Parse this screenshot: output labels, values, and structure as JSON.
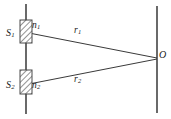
{
  "figure": {
    "type": "optics-ray-diagram",
    "background_color": "#ffffff",
    "line_color": "#3a3a3a",
    "hatch_color": "#6b6b6b"
  },
  "labels": {
    "slit_top": {
      "base": "S",
      "sub": "1"
    },
    "slit_bottom": {
      "base": "S",
      "sub": "2"
    },
    "index_top": {
      "base": "n",
      "sub": "1"
    },
    "index_bottom": {
      "base": "n",
      "sub": "2"
    },
    "ray_top": {
      "base": "r",
      "sub": "1"
    },
    "ray_bottom": {
      "base": "r",
      "sub": "2"
    },
    "observation_point": {
      "base": "O",
      "sub": ""
    }
  },
  "geometry": {
    "barrier_line": {
      "x": 26,
      "y1": 4,
      "y2": 114
    },
    "screen_line": {
      "x": 157,
      "y1": 6,
      "y2": 113
    },
    "slit_top_rect": {
      "x": 20,
      "y": 20,
      "width": 12,
      "height": 23
    },
    "slit_bottom_rect": {
      "x": 20,
      "y": 70,
      "width": 12,
      "height": 24
    },
    "ray_top": {
      "x1": 29,
      "y1": 33,
      "x2": 157,
      "y2": 58
    },
    "ray_bottom": {
      "x1": 29,
      "y1": 84,
      "x2": 157,
      "y2": 59
    }
  }
}
